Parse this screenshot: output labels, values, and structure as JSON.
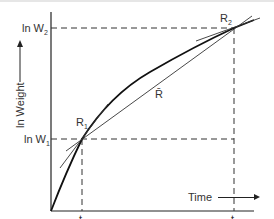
{
  "diagram": {
    "title": "",
    "y_axis": {
      "label": "ln Weight",
      "arrow": "up-arrow",
      "ticks": [
        {
          "label": "ln W",
          "subscript": "2",
          "y": 28
        },
        {
          "label": "ln W",
          "subscript": "1",
          "y": 139
        }
      ]
    },
    "x_axis": {
      "label": "Time",
      "arrow": "right-arrow",
      "ticks": [
        {
          "label": "t",
          "subscript": "1",
          "x": 82
        },
        {
          "label": "t",
          "subscript": "2",
          "x": 234
        }
      ]
    },
    "points": [
      {
        "label": "R",
        "subscript": "1",
        "x": 82,
        "y": 139
      },
      {
        "label": "R",
        "subscript": "2",
        "x": 234,
        "y": 28
      }
    ],
    "mean_slope_label": "R̄"
  }
}
